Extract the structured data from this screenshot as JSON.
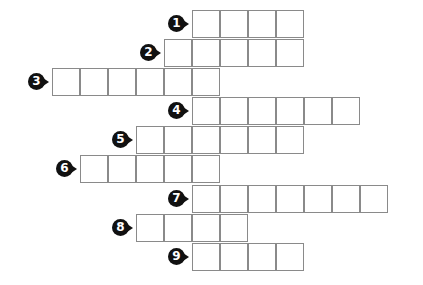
{
  "puzzle": {
    "type": "crossword-style letter grid",
    "rows": [
      {
        "number": "1",
        "start_x": 192,
        "y": 10,
        "cells": 4
      },
      {
        "number": "2",
        "start_x": 164,
        "y": 39,
        "cells": 5
      },
      {
        "number": "3",
        "start_x": 52,
        "y": 68,
        "cells": 6
      },
      {
        "number": "4",
        "start_x": 192,
        "y": 97,
        "cells": 6
      },
      {
        "number": "5",
        "start_x": 136,
        "y": 126,
        "cells": 6
      },
      {
        "number": "6",
        "start_x": 80,
        "y": 155,
        "cells": 5
      },
      {
        "number": "7",
        "start_x": 192,
        "y": 185,
        "cells": 7
      },
      {
        "number": "8",
        "start_x": 136,
        "y": 214,
        "cells": 4
      },
      {
        "number": "9",
        "start_x": 192,
        "y": 243,
        "cells": 4
      }
    ],
    "colors": {
      "cell_border": "#8a8a8a",
      "marker": "#111111"
    }
  }
}
